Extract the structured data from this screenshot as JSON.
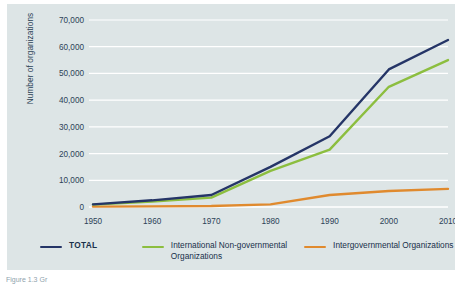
{
  "figure": {
    "background_color": "#dde5e6",
    "page_background": "#ffffff",
    "caption_partial": "Figure 1.3 Gr"
  },
  "chart_data": {
    "type": "line",
    "title": "",
    "xlabel": "",
    "ylabel": "Number of organizations",
    "x": [
      1950,
      1960,
      1970,
      1980,
      1990,
      2000,
      2010
    ],
    "xtick_labels": [
      "1950",
      "1960",
      "1970",
      "1980",
      "1990",
      "2000",
      "2010"
    ],
    "ytick_labels": [
      "0",
      "10,000",
      "20,000",
      "30,000",
      "40,000",
      "50,000",
      "60,000",
      "70,000"
    ],
    "ytick_values": [
      0,
      10000,
      20000,
      30000,
      40000,
      50000,
      60000,
      70000
    ],
    "ylim": [
      0,
      70000
    ],
    "xlim": [
      1950,
      2010
    ],
    "grid": "horizontal",
    "grid_color": "#ffffff",
    "legend_position": "bottom",
    "series": [
      {
        "name": "TOTAL",
        "color": "#253567",
        "values": [
          1000,
          2500,
          4500,
          15000,
          26500,
          51500,
          62500
        ]
      },
      {
        "name": "International Non-governmental Organizations",
        "color": "#8cbe3f",
        "values": [
          900,
          2000,
          3500,
          13500,
          21500,
          45000,
          55000
        ]
      },
      {
        "name": "Intergovernmental Organizations",
        "color": "#e08a2e",
        "values": [
          150,
          250,
          350,
          1000,
          4500,
          6000,
          6800
        ]
      }
    ]
  },
  "legend": {
    "items": [
      {
        "label": "TOTAL",
        "color": "#253567"
      },
      {
        "label": "International Non-governmental Organizations",
        "color": "#8cbe3f"
      },
      {
        "label": "Intergovernmental Organizations",
        "color": "#e08a2e"
      }
    ]
  }
}
